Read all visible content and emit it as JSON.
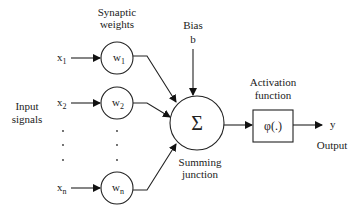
{
  "diagram": {
    "labels": {
      "synaptic_weights_line1": "Synaptic",
      "synaptic_weights_line2": "weights",
      "bias_line1": "Bias",
      "bias_line2": "b",
      "input_signals_line1": "Input",
      "input_signals_line2": "signals",
      "activation_line1": "Activation",
      "activation_line2": "function",
      "summing_line1": "Summing",
      "summing_line2": "junction",
      "output": "Output"
    },
    "inputs": [
      {
        "name": "x",
        "sub": "1"
      },
      {
        "name": "x",
        "sub": "2"
      },
      {
        "name": "x",
        "sub": "n"
      }
    ],
    "weights": [
      {
        "name": "w",
        "sub": "1"
      },
      {
        "name": "w",
        "sub": "2"
      },
      {
        "name": "w",
        "sub": "n"
      }
    ],
    "summation_symbol": "Σ",
    "activation_symbol": "φ(.)",
    "output_symbol": "y",
    "ellipsis_dot": "."
  }
}
